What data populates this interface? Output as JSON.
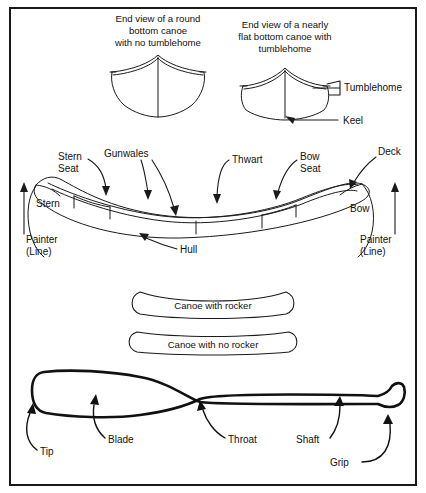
{
  "figure": {
    "background": "#ffffff",
    "line_color": "#1a1a1a"
  },
  "cross_sections": {
    "round_bottom": {
      "caption_line1": "End view of a round",
      "caption_line2": "bottom canoe",
      "caption_line3": "with no tumblehome"
    },
    "flat_bottom": {
      "caption_line1": "End view of a nearly",
      "caption_line2": "flat bottom canoe with",
      "caption_line3": "tumblehome",
      "labels": {
        "tumblehome": "Tumblehome",
        "keel": "Keel"
      }
    }
  },
  "side_view": {
    "labels": {
      "stern_seat_line1": "Stern",
      "stern_seat_line2": "Seat",
      "gunwales": "Gunwales",
      "thwart": "Thwart",
      "bow_seat_line1": "Bow",
      "bow_seat_line2": "Seat",
      "deck": "Deck",
      "stern": "Stern",
      "bow": "Bow",
      "hull": "Hull",
      "painter_left_line1": "Painter",
      "painter_left_line2": "(Line)",
      "painter_right_line1": "Painter",
      "painter_right_line2": "(Line)"
    }
  },
  "rocker": {
    "with_rocker": "Canoe with rocker",
    "no_rocker": "Canoe with no rocker"
  },
  "paddle": {
    "labels": {
      "tip": "Tip",
      "blade": "Blade",
      "throat": "Throat",
      "shaft": "Shaft",
      "grip": "Grip"
    }
  }
}
